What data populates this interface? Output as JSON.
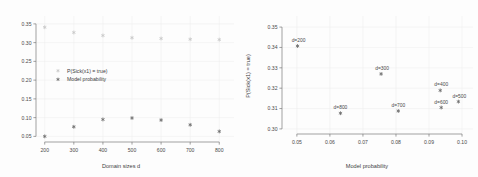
{
  "figure": {
    "background": "#fdfdfd",
    "panels": 2
  },
  "chart_data": [
    {
      "type": "scatter",
      "panel": "left",
      "title": "",
      "xlabel": "Domain sizes d",
      "ylabel": "",
      "xlim": [
        170,
        830
      ],
      "ylim": [
        0.035,
        0.355
      ],
      "xticks": [
        200,
        300,
        400,
        500,
        600,
        700,
        800
      ],
      "xticklabels": [
        "200",
        "300",
        "400",
        "500",
        "600",
        "700",
        "800"
      ],
      "yticks": [
        0.05,
        0.1,
        0.15,
        0.2,
        0.25,
        0.3,
        0.35
      ],
      "yticklabels": [
        "0.05",
        "0.10",
        "0.15",
        "0.20",
        "0.25",
        "0.30",
        "0.35"
      ],
      "grid": true,
      "legend_position": "center-left",
      "x": [
        200,
        300,
        400,
        500,
        600,
        700,
        800
      ],
      "series": [
        {
          "name": "P(Sick(x1) = true)",
          "color": "#c9c9c9",
          "marker": "asterisk",
          "values": [
            0.341,
            0.327,
            0.319,
            0.313,
            0.311,
            0.309,
            0.308
          ]
        },
        {
          "name": "Model probability",
          "color": "#6e6e6e",
          "marker": "asterisk",
          "values": [
            0.05,
            0.0755,
            0.0951,
            0.099,
            0.0935,
            0.0808,
            0.0632
          ]
        }
      ]
    },
    {
      "type": "scatter",
      "panel": "right",
      "title": "",
      "xlabel": "Model probability",
      "ylabel": "P(Sick(x1) = true)",
      "xlim": [
        0.0455,
        0.1015
      ],
      "ylim": [
        0.2975,
        0.3525
      ],
      "xticks": [
        0.05,
        0.06,
        0.07,
        0.08,
        0.09,
        0.1
      ],
      "xticklabels": [
        "0.05",
        "0.06",
        "0.07",
        "0.08",
        "0.09",
        "0.10"
      ],
      "yticks": [
        0.3,
        0.31,
        0.32,
        0.33,
        0.34,
        0.35
      ],
      "yticklabels": [
        "0.30",
        "0.31",
        "0.32",
        "0.33",
        "0.34",
        "0.35"
      ],
      "grid": true,
      "marker": "asterisk",
      "color": "#6e6e6e",
      "points": [
        {
          "label": "d=200",
          "x": 0.0502,
          "y": 0.3407,
          "label_dx": 1,
          "label_dy": -4
        },
        {
          "label": "d=300",
          "x": 0.0755,
          "y": 0.327,
          "label_dx": 1,
          "label_dy": -4
        },
        {
          "label": "d=400",
          "x": 0.0934,
          "y": 0.3189,
          "label_dx": 1,
          "label_dy": -4
        },
        {
          "label": "d=500",
          "x": 0.0989,
          "y": 0.3134,
          "label_dx": 1,
          "label_dy": -4
        },
        {
          "label": "d=600",
          "x": 0.0937,
          "y": 0.3105,
          "label_dx": 0,
          "label_dy": -4
        },
        {
          "label": "d=700",
          "x": 0.0807,
          "y": 0.3088,
          "label_dx": 0,
          "label_dy": -4
        },
        {
          "label": "d=800",
          "x": 0.0632,
          "y": 0.3077,
          "label_dx": 0,
          "label_dy": -4
        }
      ]
    }
  ]
}
